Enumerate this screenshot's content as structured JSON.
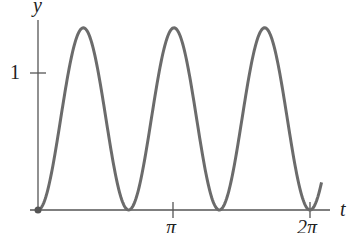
{
  "chart_data": {
    "type": "line",
    "title": "",
    "xlabel": "t",
    "ylabel": "y",
    "x_ticks": [
      {
        "value": 3.14159,
        "label": "π"
      },
      {
        "value": 6.28318,
        "label": "2π"
      }
    ],
    "y_ticks": [
      {
        "value": 1,
        "label": "1"
      }
    ],
    "xlim": [
      0,
      6.55
    ],
    "ylim": [
      0,
      1.33
    ],
    "grid": false,
    "legend": null,
    "series": [
      {
        "name": "y(t)",
        "color": "#6b6b6b",
        "description": "periodic, nonnegative; zeros at 0, 2π/3, 4π/3, 2π; peaks ≈1.33 at π/3, π, 5π/3",
        "x": [
          0,
          0.5236,
          1.0472,
          1.5708,
          2.0944,
          2.618,
          3.1416,
          3.6652,
          4.1888,
          4.7124,
          5.236,
          5.7596,
          6.2832,
          6.55
        ],
        "y": [
          0,
          0.665,
          1.33,
          0.665,
          0,
          0.665,
          1.33,
          0.665,
          0,
          0.665,
          1.33,
          0.665,
          0,
          0.47
        ]
      }
    ],
    "start_point_marker": {
      "x": 0,
      "y": 0
    }
  },
  "labels": {
    "y_axis": "y",
    "x_axis": "t",
    "y_tick": "1",
    "x_tick_1": "π",
    "x_tick_2": "2π"
  }
}
